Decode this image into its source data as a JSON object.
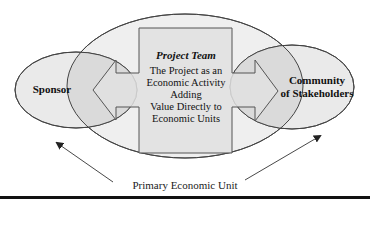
{
  "diagram": {
    "sponsor": {
      "label": "Sponsor"
    },
    "community": {
      "label_line1": "Community",
      "label_line2": "of Stakeholders"
    },
    "project_team": {
      "title": "Project Team",
      "lines": [
        "The Project as an",
        "Economic Activity",
        "Adding",
        "Value Directly to",
        "Economic Units"
      ]
    },
    "caption": "Primary Economic Unit"
  },
  "colors": {
    "ellipse_fill": "#ececec",
    "overlap_fill": "#d9d9d9",
    "box_fill": "#e3e3e3",
    "stroke": "#444444",
    "rule": "#111111"
  }
}
